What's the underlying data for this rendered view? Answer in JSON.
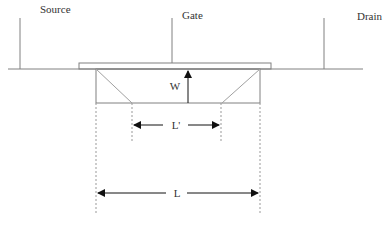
{
  "labels": {
    "source": "Source",
    "gate": "Gate",
    "drain": "Drain",
    "width": "W",
    "effective_length": "L'",
    "length": "L"
  },
  "colors": {
    "line": "#808080",
    "arrow": "#111111",
    "text": "#333333",
    "background": "#ffffff"
  }
}
